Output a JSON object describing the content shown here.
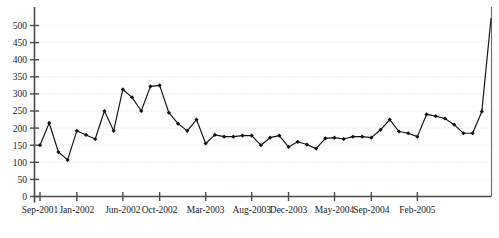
{
  "chart_data": {
    "type": "line",
    "title": "",
    "subtitle": "",
    "xlabel": "",
    "ylabel": "",
    "grid": true,
    "legend": false,
    "legend_position": "none",
    "ylim": [
      0,
      520
    ],
    "ytick_values": [
      0,
      50,
      100,
      150,
      200,
      250,
      300,
      350,
      400,
      450,
      500
    ],
    "ytick_labels": [
      "0",
      "50",
      "100",
      "150",
      "200",
      "250",
      "300",
      "350",
      "400",
      "450",
      "500"
    ],
    "xtick_labels": [
      "Sep-2001",
      "Jan-2002",
      "Jun-2002",
      "Oct-2002",
      "Mar-2003",
      "Aug-2003",
      "Dec-2003",
      "May-2004",
      "Sep-2004",
      "Feb-2005"
    ],
    "xtick_indices": [
      0,
      4,
      9,
      13,
      18,
      23,
      27,
      32,
      36,
      41
    ],
    "x_index_count": 50,
    "series": [
      {
        "name": "series-1",
        "color": "#111111",
        "marker": "filled-diamond",
        "values": [
          150,
          215,
          130,
          107,
          192,
          180,
          168,
          250,
          192,
          313,
          290,
          250,
          322,
          325,
          245,
          213,
          192,
          225,
          155,
          180,
          175,
          175,
          178,
          178,
          150,
          172,
          178,
          145,
          160,
          152,
          140,
          170,
          172,
          168,
          175,
          175,
          172,
          195,
          225,
          190,
          185,
          175,
          240,
          235,
          228,
          210,
          185,
          185,
          248,
          520
        ]
      }
    ]
  },
  "axis": {
    "y_axis_name": "y-axis",
    "x_axis_name": "x-axis",
    "right_border_name": "plot-right-border"
  }
}
